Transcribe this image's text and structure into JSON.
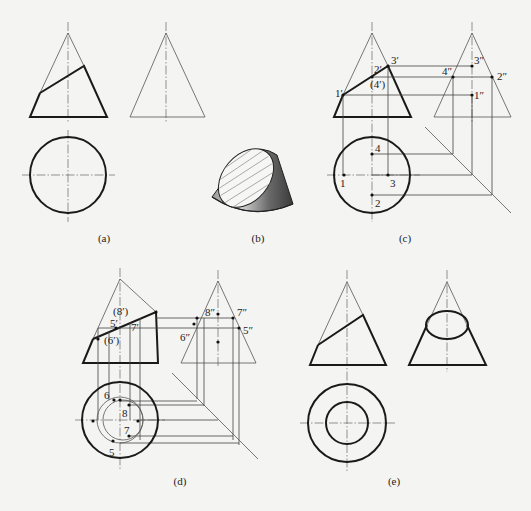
{
  "figure": {
    "captions": {
      "a": "(a)",
      "b": "(b)",
      "c": "(c)",
      "d": "(d)",
      "e": "(e)"
    },
    "panel_c_labels": {
      "p1f": "1′",
      "p2f": "2′",
      "p3f": "3′",
      "p4f": "(4′)",
      "p1s": "1″",
      "p2s": "2″",
      "p3s": "3″",
      "p4s": "4″",
      "p1t": "1",
      "p2t": "2",
      "p3t": "3",
      "p4t": "4"
    },
    "panel_d_labels": {
      "p5f": "5′",
      "p6f": "(6′)",
      "p7f": "7′",
      "p8f": "(8′)",
      "p5s": "5″",
      "p6s": "6″",
      "p7s": "7″",
      "p8s": "8″",
      "p5t": "5",
      "p6t": "6",
      "p7t": "7",
      "p8t": "8"
    },
    "colors": {
      "ink": "#1a1a1a",
      "background": "#f4f4f2",
      "cone_shade": "#5a5a5a"
    }
  }
}
